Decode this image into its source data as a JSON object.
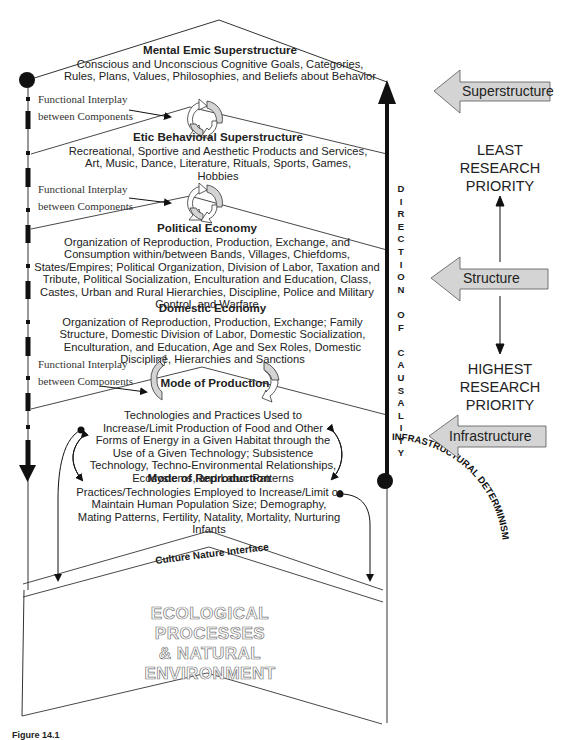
{
  "diagram": {
    "blocks": {
      "mental_emic": {
        "title": "Mental Emic Superstructure",
        "body": "Conscious and Unconscious Cognitive Goals, Categories, Rules, Plans, Values, Philosophies, and Beliefs about Behavior"
      },
      "etic_behavioral": {
        "title": "Etic Behavioral Superstructure",
        "body": "Recreational, Sportive and Aesthetic Products and Services, Art, Music, Dance, Literature, Rituals, Sports, Games, Hobbies"
      },
      "political_economy": {
        "title": "Political Economy",
        "body": "Organization of Reproduction, Production, Exchange, and Consumption within/between Bands, Villages, Chiefdoms, States/Empires; Political Organization, Division of Labor, Taxation and Tribute, Political Socialization, Enculturation and Education, Class, Castes, Urban and Rural Hierarchies, Discipline, Police and Military Control, and Warfare"
      },
      "domestic_economy": {
        "title": "Domestic Economy",
        "body": "Organization of Reproduction, Production, Exchange; Family Structure, Domestic Division of Labor, Domestic Socialization, Enculturation, and Education, Age and Sex Roles, Domestic Discipline, Hierarchies and Sanctions"
      },
      "mode_of_production": {
        "title": "Mode of Production",
        "body": "Technologies and Practices Used to Increase/Limit Production of Food and Other Forms of Energy in a Given Habitat through the Use of a Given Technology; Subsistence Technology, Techno-Environmental Relationships, Ecosystems, and Labor Patterns"
      },
      "mode_of_reproduction": {
        "title": "Mode of Reproduction",
        "body": "Practices/Technologies Employed to Increase/Limit or Maintain Human Population Size; Demography, Mating Patterns, Fertility, Natality, Mortality, Nurturing Infants"
      }
    },
    "interplay_label": {
      "line1": "Functional Interplay",
      "line2": "between Components"
    },
    "culture_nature_interface": "Culture Nature Interface",
    "ecological": {
      "line1": "ECOLOGICAL PROCESSES",
      "line2": "& NATURAL ENVIRONMENT"
    },
    "direction_of_causality": [
      "D",
      "I",
      "R",
      "E",
      "C",
      "T",
      "I",
      "O",
      "N",
      "",
      "O",
      "F",
      "",
      "C",
      "A",
      "U",
      "S",
      "A",
      "L",
      "I",
      "T",
      "Y"
    ],
    "infrastructural_determinism": "INFRASTRUCTURAL DETERMINISM"
  },
  "side_panel": {
    "arrows": [
      {
        "label": "Superstructure"
      },
      {
        "label": "Structure"
      },
      {
        "label": "Infrastructure"
      }
    ],
    "least_priority": {
      "line1": "LEAST",
      "line2": "RESEARCH",
      "line3": "PRIORITY"
    },
    "highest_priority": {
      "line1": "HIGHEST",
      "line2": "RESEARCH",
      "line3": "PRIORITY"
    }
  },
  "caption": "Figure 14.1",
  "colors": {
    "arrow_fill": "#d4d4d4",
    "line": "#333333",
    "ink": "#111111"
  }
}
